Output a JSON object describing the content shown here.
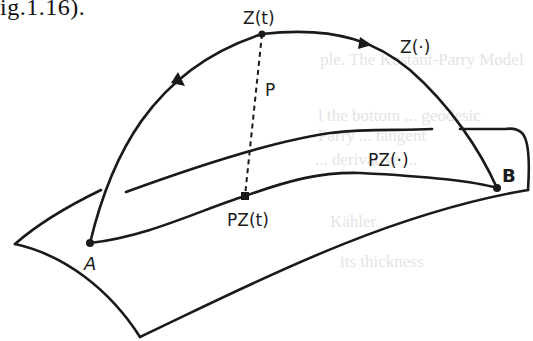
{
  "caption_fragment": "ig.1.16).",
  "background_bleedthrough": [
    {
      "text": "ple. The Kostant-Parry Model",
      "x": 320,
      "y": 62
    },
    {
      "text": "l the bottom ... geodesic",
      "x": 318,
      "y": 118
    },
    {
      "text": "Parry ... tangent",
      "x": 318,
      "y": 136
    },
    {
      "text": "... derivative ...",
      "x": 315,
      "y": 160
    },
    {
      "text": "Kähler",
      "x": 330,
      "y": 222
    },
    {
      "text": "its thickness",
      "x": 340,
      "y": 262
    }
  ],
  "diagram": {
    "colors": {
      "stroke": "#1a1a1a",
      "background": "#ffffff"
    },
    "labels": {
      "z_t": "Z(t)",
      "z_dot": "Z(·)",
      "p": "P",
      "pz_dot": "PZ(·)",
      "pz_t": "PZ(t)",
      "a": "A",
      "b": "B"
    },
    "points": {
      "z_t": [
        262,
        34
      ],
      "pz_t": [
        245,
        196
      ],
      "a": [
        90,
        243
      ],
      "b": [
        497,
        188
      ]
    }
  }
}
